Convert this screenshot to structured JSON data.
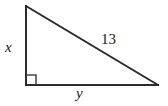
{
  "figure": {
    "type": "right-triangle-diagram",
    "background_color": "#ffffff",
    "stroke_color": "#2b2b2b",
    "labels": {
      "vertical_leg": "x",
      "hypotenuse": "13",
      "horizontal_leg": "y"
    },
    "geometry": {
      "top_vertex": [
        26,
        6
      ],
      "right_angle_vertex": [
        26,
        85
      ],
      "right_vertex": [
        158,
        85
      ],
      "right_angle_marker_size": 10
    }
  }
}
